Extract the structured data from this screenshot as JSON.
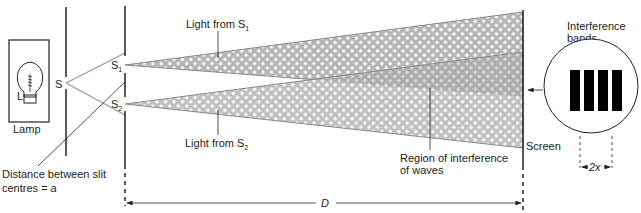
{
  "diagram": {
    "labels": {
      "lamp": "Lamp",
      "bulb": "L",
      "slit_s": "S",
      "slit_s1": "S",
      "slit_s1_sub": "1",
      "slit_s2": "S",
      "slit_s2_sub": "2",
      "light_from_s1": "Light from S",
      "light_from_s1_sub": "1",
      "light_from_s2": "Light from S",
      "light_from_s2_sub": "2",
      "distance_line1": "Distance between slit",
      "distance_line2": "centres = ",
      "distance_var": "a",
      "region_line1": "Region of interference",
      "region_line2": "of waves",
      "screen": "Screen",
      "bands_line1": "Interference",
      "bands_line2": "bands",
      "fringe_spacing": "2x",
      "distance_D": "D"
    },
    "colors": {
      "line": "#222222",
      "beam_fill": "#b3b3b3",
      "beam_edge": "#8a8a8a",
      "hatch": "#ffffff",
      "band": "#000000"
    },
    "band_count": 4
  }
}
